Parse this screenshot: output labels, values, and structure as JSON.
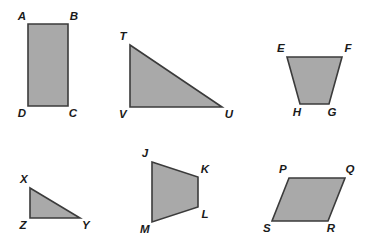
{
  "page": {
    "background_color": "#ffffff",
    "width": 371,
    "height": 242
  },
  "style": {
    "shape_fill": "#a9a9a9",
    "shape_stroke": "#3b3b3b",
    "label_color": "#1a1a1a"
  },
  "figures": [
    {
      "id": "rectangle-abcd",
      "name": "rectangle-abcd",
      "shape_type": "rectangle",
      "points": "28,24 68,24 68,106 28,106",
      "vertices": [
        {
          "label": "A",
          "x": 22,
          "y": 17
        },
        {
          "label": "B",
          "x": 74,
          "y": 17
        },
        {
          "label": "C",
          "x": 73,
          "y": 114
        },
        {
          "label": "D",
          "x": 22,
          "y": 114
        }
      ]
    },
    {
      "id": "triangle-tvu",
      "name": "triangle-tvu",
      "shape_type": "right-triangle",
      "points": "130,45 222,107 130,107",
      "vertices": [
        {
          "label": "T",
          "x": 123,
          "y": 37
        },
        {
          "label": "U",
          "x": 229,
          "y": 115
        },
        {
          "label": "V",
          "x": 123,
          "y": 115
        }
      ]
    },
    {
      "id": "trapezoid-efgh",
      "name": "trapezoid-efgh",
      "shape_type": "trapezoid",
      "points": "287,57 342,57 329,104 300,104",
      "vertices": [
        {
          "label": "E",
          "x": 281,
          "y": 49
        },
        {
          "label": "F",
          "x": 348,
          "y": 49
        },
        {
          "label": "G",
          "x": 332,
          "y": 113
        },
        {
          "label": "H",
          "x": 297,
          "y": 113
        }
      ]
    },
    {
      "id": "triangle-xzy",
      "name": "triangle-xzy",
      "shape_type": "right-triangle",
      "points": "30,188 80,218 30,218",
      "vertices": [
        {
          "label": "X",
          "x": 24,
          "y": 180
        },
        {
          "label": "Y",
          "x": 86,
          "y": 226
        },
        {
          "label": "Z",
          "x": 23,
          "y": 226
        }
      ]
    },
    {
      "id": "trapezoid-jklm",
      "name": "trapezoid-jklm",
      "shape_type": "trapezoid",
      "points": "152,162 198,177 198,207 152,222",
      "vertices": [
        {
          "label": "J",
          "x": 145,
          "y": 154
        },
        {
          "label": "K",
          "x": 205,
          "y": 170
        },
        {
          "label": "L",
          "x": 205,
          "y": 215
        },
        {
          "label": "M",
          "x": 145,
          "y": 230
        }
      ]
    },
    {
      "id": "parallelogram-pqrs",
      "name": "parallelogram-pqrs",
      "shape_type": "parallelogram",
      "points": "289,178 345,178 328,221 272,221",
      "vertices": [
        {
          "label": "P",
          "x": 283,
          "y": 170
        },
        {
          "label": "Q",
          "x": 350,
          "y": 170
        },
        {
          "label": "R",
          "x": 331,
          "y": 229
        },
        {
          "label": "S",
          "x": 267,
          "y": 229
        }
      ]
    }
  ]
}
